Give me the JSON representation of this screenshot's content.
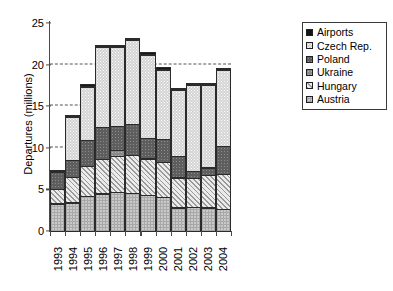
{
  "chart_data": {
    "type": "bar",
    "subtype": "stacked-bar",
    "title": "",
    "xlabel": "",
    "ylabel": "Departures (millions)",
    "ylim": [
      0,
      25
    ],
    "yticks": [
      0,
      5,
      10,
      15,
      20,
      25
    ],
    "ytick_labels": [
      "0",
      "5",
      "10",
      "15",
      "20",
      "25"
    ],
    "gridlines": [
      5,
      10,
      15,
      20
    ],
    "grid": "horizontal-dashed",
    "legend_position": "right-outside",
    "categories": [
      "1993",
      "1994",
      "1995",
      "1996",
      "1997",
      "1998",
      "1999",
      "2000",
      "2001",
      "2002",
      "2003",
      "2004"
    ],
    "series": [
      {
        "name": "Austria",
        "color": "#c9c9c9",
        "pattern": "crosshatch-light",
        "values": [
          3.4,
          3.5,
          4.3,
          4.6,
          4.8,
          4.7,
          4.4,
          4.2,
          2.9,
          3.0,
          2.9,
          2.7
        ]
      },
      {
        "name": "Hungary",
        "color": "#c6c6c6",
        "pattern": "diagonal-hatch",
        "values": [
          1.8,
          3.2,
          3.7,
          4.2,
          4.4,
          4.6,
          4.5,
          4.3,
          3.7,
          3.6,
          4.0,
          4.3
        ]
      },
      {
        "name": "Ukraine",
        "color": "#8a8a8a",
        "pattern": "dotted-medium-gray",
        "values": [
          0.0,
          0.0,
          0.0,
          0.0,
          0.8,
          0.0,
          0.0,
          0.0,
          0.0,
          0.0,
          0.0,
          0.0
        ]
      },
      {
        "name": "Poland",
        "color": "#5e5e5e",
        "pattern": "dotted-dark-gray",
        "values": [
          2.2,
          2.1,
          3.2,
          4.0,
          3.0,
          3.8,
          2.6,
          2.8,
          2.7,
          0.9,
          1.0,
          3.5
        ]
      },
      {
        "name": "Czech Rep.",
        "color": "#d3d3d3",
        "pattern": "dotted-light",
        "values": [
          0.0,
          5.3,
          6.5,
          9.7,
          9.6,
          10.2,
          10.1,
          8.5,
          8.0,
          10.4,
          10.0,
          9.3
        ]
      },
      {
        "name": "Airports",
        "color": "#151515",
        "pattern": "solid-black",
        "values": [
          0.2,
          0.2,
          0.3,
          0.3,
          0.3,
          0.3,
          0.3,
          0.3,
          0.2,
          0.2,
          0.2,
          0.2
        ]
      }
    ],
    "totals": [
      7.6,
      14.3,
      18.0,
      22.8,
      22.9,
      23.6,
      21.9,
      20.1,
      17.5,
      18.1,
      18.1,
      20.0
    ],
    "stack_order_bottom_to_top": [
      "Austria",
      "Hungary",
      "Ukraine",
      "Poland",
      "Czech Rep.",
      "Airports"
    ]
  },
  "legend": {
    "items": [
      {
        "label": "Airports",
        "swatch": "solid-black"
      },
      {
        "label": "Czech Rep.",
        "swatch": "dotted-light"
      },
      {
        "label": "Poland",
        "swatch": "dotted-dark-gray"
      },
      {
        "label": "Ukraine",
        "swatch": "dotted-medium-gray"
      },
      {
        "label": "Hungary",
        "swatch": "diagonal-hatch"
      },
      {
        "label": "Austria",
        "swatch": "crosshatch-light"
      }
    ]
  }
}
